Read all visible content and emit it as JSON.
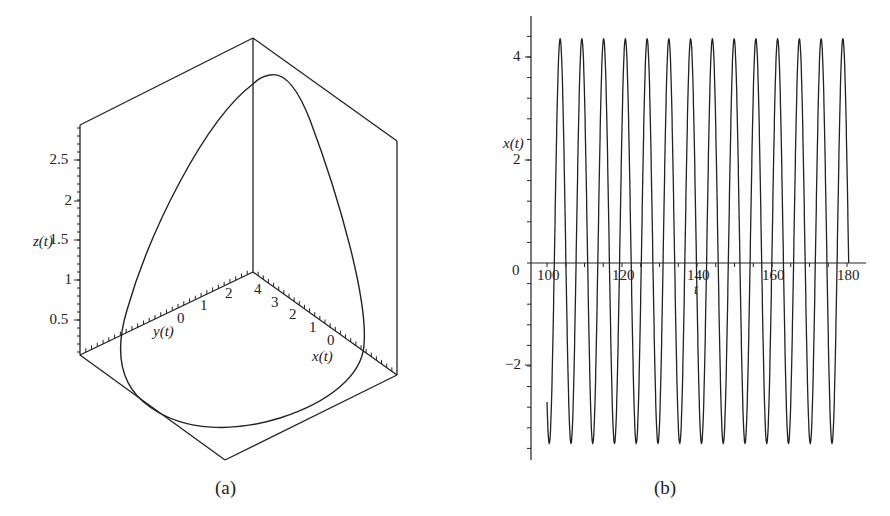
{
  "figure": {
    "panels": [
      {
        "id": "a",
        "caption": "(a)"
      },
      {
        "id": "b",
        "caption": "(b)"
      }
    ]
  },
  "chart_data": [
    {
      "type": "line",
      "subtype": "3d-parametric-curve",
      "title": "",
      "caption": "(a)",
      "xlabel": "x(t)",
      "ylabel": "y(t)",
      "zlabel": "z(t)",
      "x_ticks": [
        "0",
        "1",
        "2",
        "3",
        "4"
      ],
      "y_ticks": [
        "0",
        "1",
        "2"
      ],
      "z_ticks": [
        "0.5",
        "1",
        "1.5",
        "2",
        "2.5"
      ],
      "xlim": [
        -0.5,
        4.6
      ],
      "ylim": [
        -2.5,
        3.0
      ],
      "zlim": [
        0,
        3.0
      ],
      "grid": false,
      "box": true,
      "description": "Closed limit-cycle loop: wide rounded base near z≈0.1, rising to a peak near z≈2.8"
    },
    {
      "type": "line",
      "title": "",
      "caption": "(b)",
      "xlabel": "t",
      "ylabel": "x(t)",
      "x_ticks": [
        "100",
        "120",
        "140",
        "160",
        "180"
      ],
      "y_ticks": [
        "-2",
        "0",
        "2",
        "4"
      ],
      "xlim": [
        96,
        182
      ],
      "ylim": [
        -3.8,
        4.7
      ],
      "grid": false,
      "series": [
        {
          "name": "x(t)",
          "t_start": 100,
          "t_end": 180.5,
          "x_start": -3.2,
          "x_end": -2.8,
          "max": 4.35,
          "min": -3.5,
          "period": 5.8,
          "peaks_t": [
            103.5,
            109.3,
            115.1,
            120.9,
            126.7,
            132.5,
            138.3,
            144.1,
            149.9,
            155.7,
            161.5,
            167.3,
            173.1,
            178.9
          ],
          "troughs_t": [
            100.4,
            106.2,
            112.0,
            117.8,
            123.6,
            129.4,
            135.2,
            141.0,
            146.8,
            152.6,
            158.4,
            164.2,
            170.0,
            175.8
          ]
        }
      ]
    }
  ],
  "panel_a": {
    "zlabel": "z(t)",
    "ylabel": "y(t)",
    "xlabel": "x(t)",
    "z_ticks": [
      {
        "label": "2.5",
        "y": 160
      },
      {
        "label": "2",
        "y": 201
      },
      {
        "label": "1.5",
        "y": 240
      },
      {
        "label": "1",
        "y": 280
      },
      {
        "label": "0.5",
        "y": 320
      }
    ],
    "y_ticks": [
      {
        "label": "0",
        "x": 181,
        "y": 319
      },
      {
        "label": "1",
        "x": 204,
        "y": 306
      },
      {
        "label": "2",
        "x": 229,
        "y": 294
      }
    ],
    "x_ticks": [
      {
        "label": "4",
        "x": 258,
        "y": 290
      },
      {
        "label": "3",
        "x": 275,
        "y": 303
      },
      {
        "label": "2",
        "x": 293,
        "y": 315
      },
      {
        "label": "1",
        "x": 313,
        "y": 328
      },
      {
        "label": "0",
        "x": 331,
        "y": 341
      }
    ],
    "caption": "(a)"
  },
  "panel_b": {
    "ylabel": "x(t)",
    "xlabel": "t",
    "origin_label": "0",
    "y_ticks": [
      {
        "label": "4",
        "y": 57
      },
      {
        "label": "2",
        "y": 160
      },
      {
        "label": "−2",
        "y": 365
      }
    ],
    "x_ticks": [
      {
        "label": "100",
        "x": 547
      },
      {
        "label": "120",
        "x": 622
      },
      {
        "label": "140",
        "x": 697
      },
      {
        "label": "160",
        "x": 772
      },
      {
        "label": "180",
        "x": 847
      }
    ],
    "caption": "(b)"
  }
}
